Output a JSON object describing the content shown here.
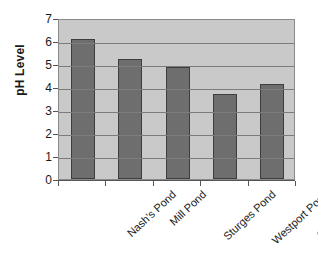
{
  "chart_data": {
    "type": "bar",
    "title": "",
    "subtitle": "",
    "xlabel": "",
    "ylabel": "pH Level",
    "categories": [
      "Nash's Pond",
      "Mill Pond",
      "Sturges Pond",
      "Westport Pond",
      "Old Hill Pond"
    ],
    "values": [
      6.1,
      5.2,
      4.85,
      3.7,
      4.15
    ],
    "ylim": [
      0,
      7
    ],
    "ytick_labels": [
      "7",
      "6",
      "5",
      "4",
      "3",
      "2",
      "1",
      "0"
    ],
    "ytick_values": [
      7,
      6,
      5,
      4,
      3,
      2,
      1,
      0
    ],
    "grid": true,
    "legend": false,
    "legend_position": "none",
    "colors": {
      "bar_fill": "#6e6e6e",
      "bar_outline": "#3d3d3d",
      "plot_background": "#c9c9c9",
      "gridline": "#7c7c7c",
      "axis": "#555555",
      "text": "#1a1a1a",
      "figure_background": "#ffffff"
    }
  }
}
